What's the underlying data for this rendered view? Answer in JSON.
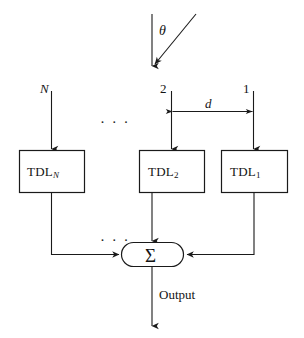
{
  "figure": {
    "type": "block-diagram",
    "background_color": "#ffffff",
    "line_color": "#1a1a1a"
  },
  "angle": {
    "label": "θ",
    "description": "incidence angle between wavefront normal and array broadside"
  },
  "sensors": [
    {
      "id": "N",
      "label": "N"
    },
    {
      "id": "2",
      "label": "2"
    },
    {
      "id": "1",
      "label": "1"
    }
  ],
  "spacing": {
    "label": "d",
    "description": "inter-element spacing between sensor 2 and sensor 1"
  },
  "blocks": [
    {
      "id": "tdl-n",
      "text": "TDL",
      "subscript": "N",
      "subscript_italic": true
    },
    {
      "id": "tdl-2",
      "text": "TDL",
      "subscript": "2",
      "subscript_italic": false
    },
    {
      "id": "tdl-1",
      "text": "TDL",
      "subscript": "1",
      "subscript_italic": false
    }
  ],
  "ellipses": {
    "top": "· · ·",
    "bottom": "· · ·"
  },
  "summing_node": {
    "symbol": "Σ",
    "shape": "stadium"
  },
  "output": {
    "label": "Output"
  }
}
